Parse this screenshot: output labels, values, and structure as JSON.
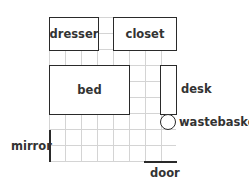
{
  "diagram": {
    "type": "room floor plan on grid",
    "grid": {
      "columns": 8,
      "rows": 9
    },
    "furniture": [
      {
        "id": "dresser",
        "label": "dresser"
      },
      {
        "id": "closet",
        "label": "closet"
      },
      {
        "id": "bed",
        "label": "bed"
      },
      {
        "id": "desk",
        "label": "desk"
      },
      {
        "id": "wastebasket",
        "label": "wastebasket"
      },
      {
        "id": "mirror",
        "label": "mirror"
      },
      {
        "id": "door",
        "label": "door"
      }
    ]
  }
}
